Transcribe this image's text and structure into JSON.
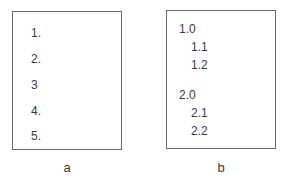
{
  "panels": [
    {
      "caption": "a",
      "items": [
        "1.",
        "2.",
        "3",
        "4.",
        "5."
      ]
    },
    {
      "caption": "b",
      "items": [
        "1.0",
        "1.1",
        "1.2",
        "2.0",
        "2.1",
        "2.2"
      ]
    }
  ]
}
